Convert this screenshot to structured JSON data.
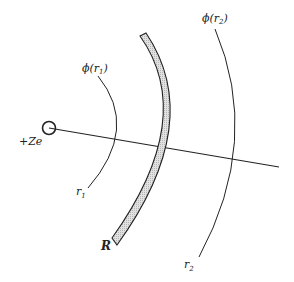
{
  "diagram": {
    "type": "shielding-of-nuclear-charge",
    "colors": {
      "ink": "#222222",
      "shell_fill": "#cfcfcf",
      "background": "#ffffff"
    },
    "nucleus": {
      "label": "+Ze",
      "center": [
        49,
        128
      ],
      "radius": 6
    },
    "radial_line": {
      "from": [
        49,
        128
      ],
      "to": [
        279,
        167
      ]
    },
    "shell": {
      "label": "R",
      "description": "shaded spherical shell of charge at radius R"
    },
    "surfaces": [
      {
        "id": "r1",
        "potential_label_prefix": "ϕ(r",
        "potential_label_sub": "1",
        "potential_label_suffix": ")",
        "radius_label": "r",
        "radius_sub": "1"
      },
      {
        "id": "r2",
        "potential_label_prefix": "ϕ(r",
        "potential_label_sub": "2",
        "potential_label_suffix": ")",
        "radius_label": "r",
        "radius_sub": "2"
      }
    ]
  }
}
